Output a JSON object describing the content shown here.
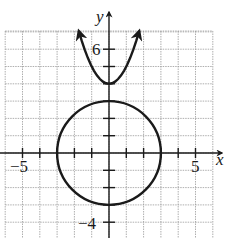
{
  "chart_data": {
    "type": "line",
    "title": "",
    "xlabel": "x",
    "ylabel": "y",
    "xlim": [
      -6,
      6
    ],
    "ylim": [
      -5,
      7
    ],
    "grid": true,
    "tick_labels": {
      "x": [
        {
          "value": -5,
          "label": "−5"
        },
        {
          "value": 5,
          "label": "5"
        }
      ],
      "y": [
        {
          "value": 6,
          "label": "6"
        },
        {
          "value": -4,
          "label": "−4"
        }
      ]
    },
    "series": [
      {
        "name": "circle",
        "kind": "circle",
        "equation": "x^2 + y^2 = 9",
        "center": [
          0,
          0
        ],
        "radius": 3
      },
      {
        "name": "parabola",
        "kind": "parabola",
        "equation": "y = x^2 + 4",
        "vertex": [
          0,
          4
        ],
        "x_range": [
          -1.75,
          1.75
        ],
        "arrows": true
      }
    ]
  },
  "labels": {
    "x_axis": "x",
    "y_axis": "y",
    "x_neg5": "−5",
    "x_pos5": "5",
    "y_pos6": "6",
    "y_neg4": "−4"
  }
}
